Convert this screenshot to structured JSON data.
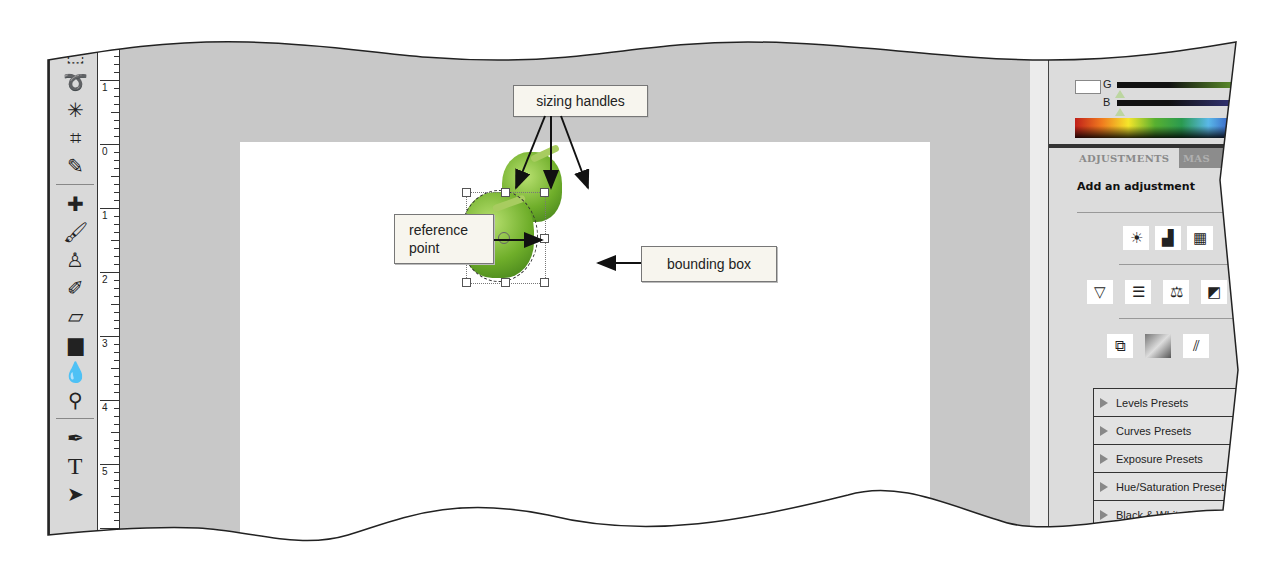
{
  "toolbar": {
    "tools": [
      {
        "name": "rectangular-marquee-tool",
        "glyph": "⬚"
      },
      {
        "name": "lasso-tool",
        "glyph": "➰"
      },
      {
        "name": "magic-wand-tool",
        "glyph": "✳"
      },
      {
        "name": "crop-tool",
        "glyph": "⌗"
      },
      {
        "name": "eyedropper-tool",
        "glyph": "✎"
      },
      {
        "name": "spot-healing-brush-tool",
        "glyph": "✚"
      },
      {
        "name": "brush-tool",
        "glyph": "🖌"
      },
      {
        "name": "clone-stamp-tool",
        "glyph": "♙"
      },
      {
        "name": "history-brush-tool",
        "glyph": "✐"
      },
      {
        "name": "eraser-tool",
        "glyph": "▱"
      },
      {
        "name": "gradient-tool",
        "glyph": "▆"
      },
      {
        "name": "blur-tool",
        "glyph": "💧"
      },
      {
        "name": "dodge-tool",
        "glyph": "⚲"
      },
      {
        "name": "pen-tool",
        "glyph": "✒"
      },
      {
        "name": "type-tool",
        "glyph": "T"
      },
      {
        "name": "path-selection-tool",
        "glyph": "➤"
      }
    ]
  },
  "ruler": {
    "labels": [
      "1",
      "0",
      "1",
      "2",
      "3",
      "4",
      "5",
      "6"
    ]
  },
  "callouts": {
    "sizing_handles": "sizing handles",
    "reference_point_line1": "reference",
    "reference_point_line2": "point",
    "bounding_box": "bounding box"
  },
  "color_panel": {
    "g_label": "G",
    "b_label": "B",
    "g_color": "#6aa630",
    "b_color": "#3a3a8a"
  },
  "adjustments_panel": {
    "tab_active": "ADJUSTMENTS",
    "tab_inactive": "MAS",
    "heading": "Add an adjustment",
    "icon_rows": [
      [
        "brightness-contrast-icon",
        "levels-icon",
        "curves-icon"
      ],
      [
        "vibrance-icon",
        "hue-saturation-icon",
        "color-balance-icon",
        "black-white-icon"
      ],
      [
        "photo-filter-icon",
        "gradient-map-icon",
        "selective-color-icon"
      ]
    ],
    "icon_glyphs": [
      [
        "☀",
        "▟",
        "▦"
      ],
      [
        "▽",
        "☰",
        "⚖",
        "◩"
      ],
      [
        "⧉",
        "▨",
        "⫽"
      ]
    ],
    "presets": [
      "Levels Presets",
      "Curves Presets",
      "Exposure Presets",
      "Hue/Saturation Presets",
      "Black & White Presets",
      "Channel Mixer Presets"
    ]
  }
}
